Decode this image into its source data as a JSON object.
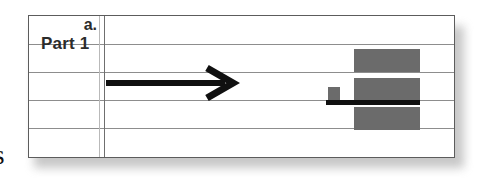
{
  "page": {
    "edge_glyph": "s",
    "background_color": "#ffffff"
  },
  "worksheet": {
    "name": "part-1-worksheet-table",
    "row_count": 5,
    "border_color": "#5c5c5c",
    "grid_line_color": "#8d8d8d",
    "labels": {
      "part_heading": "Part 1",
      "item_marker": "a."
    },
    "column_rule": {
      "light_color": "#b9b9b9",
      "dark_color": "#6f6f6f"
    }
  },
  "annotations": {
    "arrow": {
      "name": "right-arrow-annotation",
      "direction": "right",
      "color": "#101010"
    },
    "strike_bar": {
      "name": "black-strike-bar",
      "color": "#101010"
    },
    "blocks": [
      {
        "name": "redaction-block-top",
        "color": "#6b6b6b"
      },
      {
        "name": "redaction-block-middle",
        "color": "#6b6b6b"
      },
      {
        "name": "redaction-block-small",
        "color": "#6b6b6b"
      },
      {
        "name": "redaction-block-bottom",
        "color": "#6b6b6b"
      }
    ]
  }
}
